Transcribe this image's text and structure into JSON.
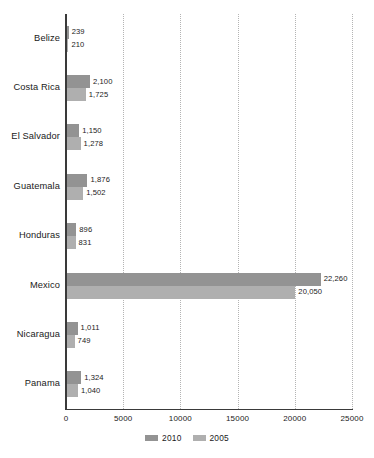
{
  "chart_data": {
    "type": "bar",
    "orientation": "horizontal",
    "title": "",
    "subtitle": "",
    "xlabel": "",
    "ylabel": "",
    "xlim": [
      0,
      25000
    ],
    "x_ticks": [
      "0",
      "5000",
      "10000",
      "15000",
      "20000",
      "25000"
    ],
    "x_tick_values": [
      0,
      5000,
      10000,
      15000,
      20000,
      25000
    ],
    "grid": "vertical-dotted",
    "legend_position": "bottom-center",
    "categories": [
      "Belize",
      "Costa Rica",
      "El Salvador",
      "Guatemala",
      "Honduras",
      "Mexico",
      "Nicaragua",
      "Panama"
    ],
    "series": [
      {
        "name": "2010",
        "color": "#939393",
        "values": [
          239,
          2100,
          1150,
          1876,
          896,
          22260,
          1011,
          1324
        ],
        "labels": [
          "239",
          "2,100",
          "1,150",
          "1,876",
          "896",
          "22,260",
          "1,011",
          "1,324"
        ]
      },
      {
        "name": "2005",
        "color": "#afafaf",
        "values": [
          210,
          1725,
          1278,
          1502,
          831,
          20050,
          749,
          1040
        ],
        "labels": [
          "210",
          "1,725",
          "1,278",
          "1,502",
          "831",
          "20,050",
          "749",
          "1,040"
        ]
      }
    ]
  },
  "legend": {
    "items": [
      {
        "label": "2010",
        "color": "#939393"
      },
      {
        "label": "2005",
        "color": "#afafaf"
      }
    ]
  },
  "colors": {
    "series_2010": "#939393",
    "series_2005": "#afafaf",
    "axis": "#3a3a3a",
    "gridline": "#b4b4b4",
    "text": "#1a1a1a",
    "background": "#ffffff"
  }
}
